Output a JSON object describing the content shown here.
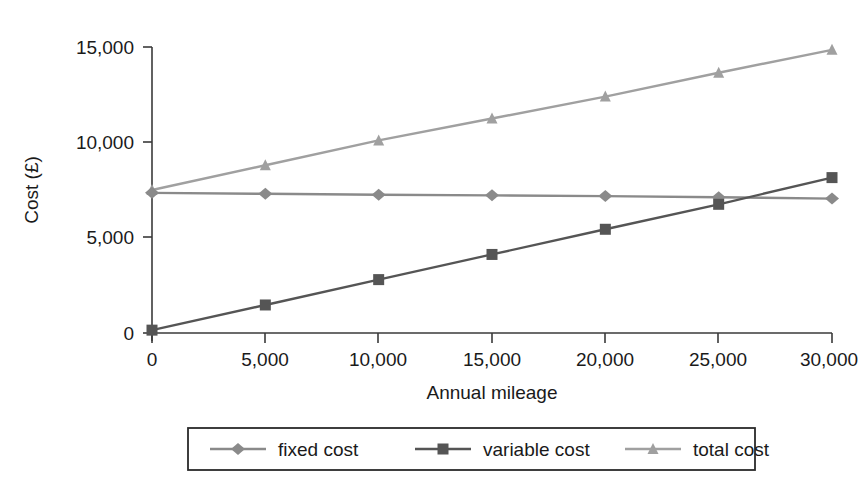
{
  "chart_data": {
    "type": "line",
    "title": "",
    "xlabel": "Annual mileage",
    "ylabel": "Cost (£)",
    "x": [
      0,
      5000,
      10000,
      15000,
      20000,
      25000,
      30000
    ],
    "xtick_labels": [
      "0",
      "5,000",
      "10,000",
      "15,000",
      "20,000",
      "25,000",
      "30,000"
    ],
    "ytick_labels": [
      "0",
      "5,000",
      "10,000",
      "15,000"
    ],
    "yticks": [
      0,
      5000,
      10000,
      15000
    ],
    "xlim": [
      0,
      30000
    ],
    "ylim": [
      0,
      15000
    ],
    "grid": false,
    "legend_position": "bottom",
    "series": [
      {
        "name": "fixed cost",
        "marker": "diamond",
        "color": "#8a8a8a",
        "values": [
          7350,
          7300,
          7250,
          7220,
          7180,
          7120,
          7050
        ]
      },
      {
        "name": "variable cost",
        "marker": "square",
        "color": "#555555",
        "values": [
          150,
          1470,
          2800,
          4120,
          5440,
          6750,
          8150
        ]
      },
      {
        "name": "total cost",
        "marker": "triangle",
        "color": "#a0a0a0",
        "values": [
          7500,
          8800,
          10100,
          11250,
          12400,
          13650,
          14850
        ]
      }
    ]
  },
  "legend": {
    "items": [
      {
        "label": "fixed cost"
      },
      {
        "label": "variable cost"
      },
      {
        "label": "total cost"
      }
    ]
  }
}
